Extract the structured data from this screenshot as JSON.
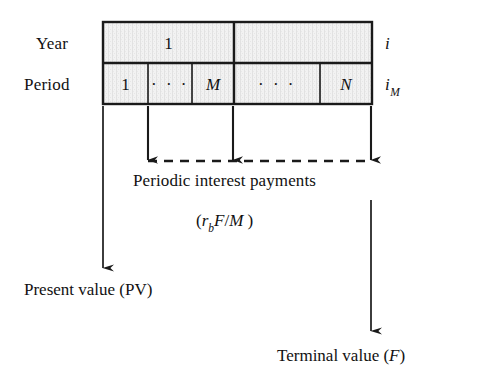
{
  "figure": {
    "type": "timeline-cash-flow-diagram",
    "background_color": "#ffffff",
    "line_color": "#1a1a1a",
    "cell_fill_color": "#ededed",
    "row_labels": {
      "year": "Year",
      "period": "Period"
    },
    "year_row": {
      "cells": [
        {
          "text": "1"
        },
        {
          "text": ""
        }
      ],
      "side_label": "i"
    },
    "period_row": {
      "cells": [
        {
          "text": "1"
        },
        {
          "text": "· · ·"
        },
        {
          "text": "M"
        },
        {
          "text": "· · ·"
        },
        {
          "text": "N"
        }
      ],
      "side_label_base": "i",
      "side_label_sub": "M"
    },
    "interest_arrows": {
      "caption": "Periodic interest payments",
      "formula_open": "(",
      "formula_r": "r",
      "formula_r_sub": "b",
      "formula_F": "F",
      "formula_slash": "/",
      "formula_M": "M",
      "formula_close": " )"
    },
    "present_value": {
      "label": "Present value (PV)"
    },
    "terminal_value": {
      "label_text": "Terminal value (",
      "label_italic": "F",
      "label_close": ")"
    }
  }
}
